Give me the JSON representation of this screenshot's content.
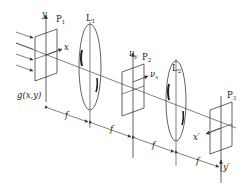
{
  "diagram": {
    "planes": {
      "p1": {
        "label": "P",
        "sub": "1",
        "axis_x": "x",
        "axis_y": "y",
        "field": "g(x,y)"
      },
      "p2": {
        "label": "P",
        "sub": "2",
        "axis_x": "ν",
        "axis_x_sub": "x",
        "axis_y": "ν",
        "axis_y_sub": "y"
      },
      "p3": {
        "label": "P",
        "sub": "3",
        "axis_x": "x′",
        "axis_y": "y′"
      }
    },
    "lenses": {
      "l1": {
        "label": "L",
        "sub": "1"
      },
      "l2": {
        "label": "L",
        "sub": "2"
      }
    },
    "distances": [
      "f",
      "f",
      "f",
      "f"
    ],
    "colors": {
      "line": "#3a3a3a",
      "background": "#ffffff"
    }
  }
}
